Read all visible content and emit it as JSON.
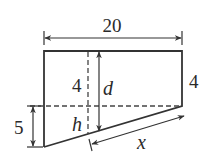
{
  "diagram": {
    "type": "geometry-figure",
    "labels": {
      "top_width": "20",
      "left_upper_height": "4",
      "right_height": "4",
      "left_lower_height": "5",
      "depth_variable": "d",
      "height_variable": "h",
      "slant_variable": "x"
    },
    "colors": {
      "stroke": "#333333",
      "background": "#ffffff"
    }
  }
}
